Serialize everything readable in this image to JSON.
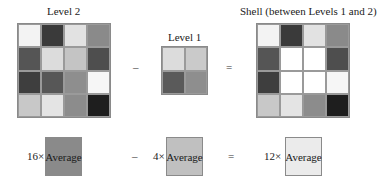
{
  "level2": {
    "title": "Level 2",
    "cells": [
      [
        "#f3f3f3",
        "#3a3a3a",
        "#e2e2e2",
        "#8a8a8a"
      ],
      [
        "#555555",
        "#dcdcdc",
        "#c4c4c4",
        "#4e4e4e"
      ],
      [
        "#3e3e3e",
        "#575757",
        "#8e8e8e",
        "#f6f6f6"
      ],
      [
        "#c8c8c8",
        "#e4e4e4",
        "#8c8c8c",
        "#1e1e1e"
      ]
    ]
  },
  "level1": {
    "title": "Level 1",
    "cells": [
      [
        "#dcdcdc",
        "#cacaca"
      ],
      [
        "#5a5a5a",
        "#8e8e8e"
      ]
    ]
  },
  "shell": {
    "title": "Shell (between Levels 1 and 2)",
    "cells": [
      [
        "#f3f3f3",
        "#3a3a3a",
        "#e2e2e2",
        "#8a8a8a"
      ],
      [
        "#555555",
        "#ffffff",
        "#ffffff",
        "#4e4e4e"
      ],
      [
        "#3e3e3e",
        "#ffffff",
        "#ffffff",
        "#f6f6f6"
      ],
      [
        "#c8c8c8",
        "#e4e4e4",
        "#8c8c8c",
        "#1e1e1e"
      ]
    ]
  },
  "operators": {
    "minus": "–",
    "equals": "="
  },
  "equation": {
    "term1": {
      "multiplier": "16×",
      "label": "Average",
      "color": "#8a8a8a"
    },
    "term2": {
      "multiplier": "4×",
      "label": "Average",
      "color": "#c0c0c0"
    },
    "term3": {
      "multiplier": "12×",
      "label": "Average",
      "color": "#ebebeb"
    }
  }
}
